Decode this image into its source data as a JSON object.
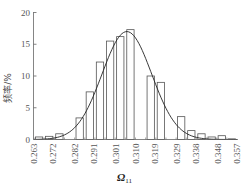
{
  "chart_data": {
    "type": "bar",
    "title": "",
    "xlabel": "Ω11",
    "xlabel_main": "Ω",
    "xlabel_sub": "11",
    "ylabel": "频率/%",
    "ylim": [
      0,
      20
    ],
    "xlim": [
      0.263,
      0.357
    ],
    "yticks": [
      0,
      5,
      10,
      15,
      20
    ],
    "xticks": [
      "0.263",
      "0.272",
      "0.282",
      "0.291",
      "0.301",
      "0.310",
      "0.319",
      "0.329",
      "0.338",
      "0.348",
      "0.357"
    ],
    "grid": false,
    "legend": null,
    "bins": [
      {
        "x0": 0.263,
        "x1": 0.2677,
        "value": 0.4
      },
      {
        "x0": 0.2677,
        "x1": 0.2724,
        "value": 0.5
      },
      {
        "x0": 0.2724,
        "x1": 0.2771,
        "value": 0.9
      },
      {
        "x0": 0.2771,
        "x1": 0.2818,
        "value": 0.0
      },
      {
        "x0": 0.2818,
        "x1": 0.2865,
        "value": 3.4
      },
      {
        "x0": 0.2865,
        "x1": 0.2912,
        "value": 7.5
      },
      {
        "x0": 0.2912,
        "x1": 0.2959,
        "value": 12.2
      },
      {
        "x0": 0.2959,
        "x1": 0.3006,
        "value": 15.5
      },
      {
        "x0": 0.3006,
        "x1": 0.3053,
        "value": 16.2
      },
      {
        "x0": 0.3053,
        "x1": 0.31,
        "value": 17.3
      },
      {
        "x0": 0.31,
        "x1": 0.3147,
        "value": 0.0
      },
      {
        "x0": 0.3147,
        "x1": 0.3194,
        "value": 10.0
      },
      {
        "x0": 0.3194,
        "x1": 0.3241,
        "value": 9.0
      },
      {
        "x0": 0.3241,
        "x1": 0.3288,
        "value": 0.0
      },
      {
        "x0": 0.3288,
        "x1": 0.3335,
        "value": 3.6
      },
      {
        "x0": 0.3335,
        "x1": 0.3382,
        "value": 1.4
      },
      {
        "x0": 0.3382,
        "x1": 0.3429,
        "value": 0.9
      },
      {
        "x0": 0.3429,
        "x1": 0.3476,
        "value": 0.4
      },
      {
        "x0": 0.3476,
        "x1": 0.3523,
        "value": 0.6
      },
      {
        "x0": 0.3523,
        "x1": 0.357,
        "value": 0.1
      }
    ],
    "normal_curve": {
      "mean": 0.306,
      "std": 0.0115,
      "peak": 17.0
    }
  }
}
